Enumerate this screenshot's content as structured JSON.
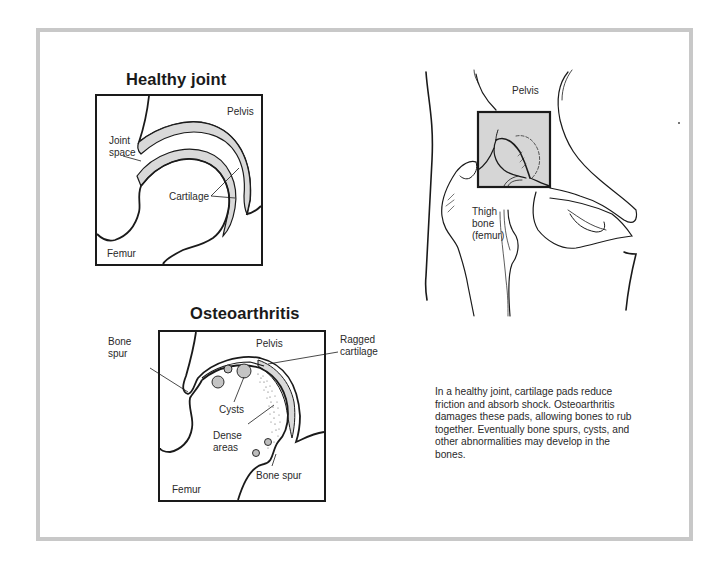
{
  "panels": {
    "healthy": {
      "title": "Healthy joint",
      "labels": {
        "pelvis": "Pelvis",
        "joint_space_1": "Joint",
        "joint_space_2": "space",
        "cartilage": "Cartilage",
        "femur": "Femur"
      }
    },
    "osteoarthritis": {
      "title": "Osteoarthritis",
      "labels": {
        "pelvis": "Pelvis",
        "bone_spur_left_1": "Bone",
        "bone_spur_left_2": "spur",
        "ragged_1": "Ragged",
        "ragged_2": "cartilage",
        "cysts": "Cysts",
        "dense_1": "Dense",
        "dense_2": "areas",
        "bone_spur_bottom": "Bone spur",
        "femur": "Femur"
      }
    },
    "anatomy": {
      "labels": {
        "pelvis": "Pelvis",
        "thigh_1": "Thigh",
        "thigh_2": "bone",
        "thigh_3": "(femur)"
      }
    }
  },
  "caption": "In a healthy joint, cartilage pads reduce friction and absorb shock. Osteoarthritis damages these pads, allowing bones to rub together. Eventually bone spurs, cysts, and other abnormalities may develop in the bones.",
  "colors": {
    "frame": "#c8c8c8",
    "ink": "#1a1a1a",
    "cartilage_fill": "#d9d9d9",
    "highlight_box": "#d6d6d6"
  }
}
